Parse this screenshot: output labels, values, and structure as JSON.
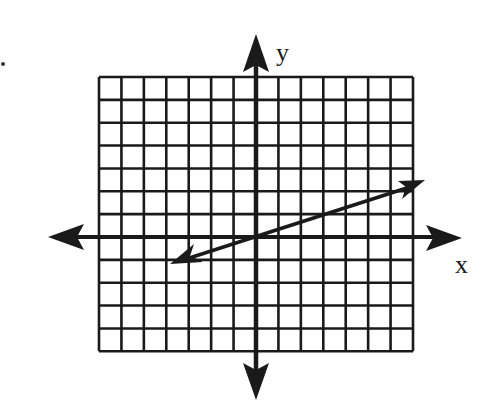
{
  "figure": {
    "type": "coordinate-plane-with-line",
    "x_axis_label": "x",
    "y_axis_label": "y",
    "grid": {
      "columns_left_of_y_axis": 7,
      "columns_right_of_y_axis": 7,
      "rows_above_x_axis": 7,
      "rows_below_x_axis": 5,
      "x_range": [
        -7,
        7
      ],
      "y_range": [
        -5,
        7
      ]
    },
    "line": {
      "description": "Line through origin with slope 1/3, arrows on both ends",
      "passes_through": [
        [
          0,
          0
        ],
        [
          3,
          1
        ],
        [
          6,
          2
        ]
      ],
      "slope": "1/3",
      "left_arrow_tip": [
        -4,
        -1.2
      ],
      "right_arrow_tip": [
        7.8,
        2.6
      ]
    },
    "colors": {
      "ink": "#1a1a1a",
      "background": "#ffffff"
    }
  }
}
